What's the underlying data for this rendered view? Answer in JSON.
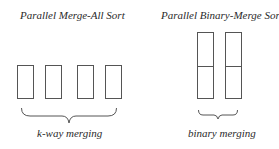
{
  "left_panel": {
    "title": "Parallel Merge-All Sort",
    "caption": "k-way merging",
    "runs": 4
  },
  "right_panel": {
    "title": "Parallel Binary-Merge Sort",
    "caption": "binary merging",
    "runs": 2,
    "segments_per_run": 2
  },
  "colors": {
    "stroke": "#555555",
    "text": "#2a2a2a",
    "background": "#ffffff"
  }
}
